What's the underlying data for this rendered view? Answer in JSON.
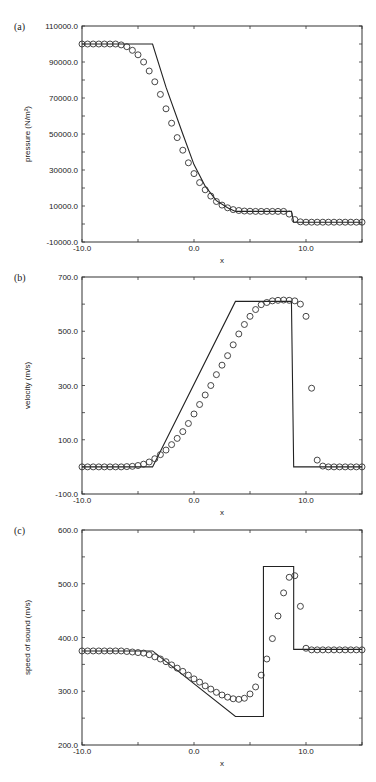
{
  "chart_data": [
    {
      "type": "line",
      "panel_label": "(a)",
      "title": "",
      "xlabel": "x",
      "ylabel": "pressure (N/m²)",
      "xlim": [
        -10,
        15
      ],
      "ylim": [
        -10000,
        110000
      ],
      "x_ticks": [
        -10,
        0,
        10
      ],
      "x_tick_labels": [
        "-10.0",
        "0.0",
        "10.0"
      ],
      "y_ticks": [
        -10000,
        10000,
        30000,
        50000,
        70000,
        90000,
        110000
      ],
      "y_tick_labels": [
        "-10000.0",
        "10000.0",
        "30000.0",
        "50000.0",
        "70000.0",
        "90000.0",
        "110000.0"
      ],
      "grid": false,
      "series": [
        {
          "name": "exact",
          "style": "line",
          "x": [
            -10,
            -3.7,
            -2.5,
            -1.0,
            0.0,
            1.0,
            2.0,
            3.0,
            3.7,
            8.7,
            8.9,
            15
          ],
          "y": [
            100000,
            100000,
            76000,
            50000,
            33000,
            21000,
            13000,
            9000,
            7000,
            7000,
            1000,
            1000
          ]
        },
        {
          "name": "numerical",
          "style": "circles",
          "x": [
            -10,
            -9.5,
            -9,
            -8.5,
            -8,
            -7.5,
            -7,
            -6.5,
            -6,
            -5.5,
            -5,
            -4.5,
            -4,
            -3.5,
            -3,
            -2.5,
            -2,
            -1.5,
            -1,
            -0.5,
            0,
            0.5,
            1,
            1.5,
            2,
            2.5,
            3,
            3.5,
            4,
            4.5,
            5,
            5.5,
            6,
            6.5,
            7,
            7.5,
            8,
            8.5,
            9,
            9.5,
            10,
            10.5,
            11,
            11.5,
            12,
            12.5,
            13,
            13.5,
            14,
            14.5,
            15
          ],
          "y": [
            100000,
            100000,
            100000,
            100000,
            100000,
            100000,
            100000,
            99500,
            98500,
            96500,
            94000,
            90000,
            85000,
            79000,
            72000,
            64000,
            56000,
            48000,
            41000,
            34000,
            28000,
            23000,
            19000,
            15500,
            12500,
            10500,
            9000,
            8000,
            7500,
            7200,
            7100,
            7000,
            7000,
            7000,
            7000,
            7000,
            7000,
            5500,
            2500,
            1200,
            1000,
            1000,
            1000,
            1000,
            1000,
            1000,
            1000,
            1000,
            1000,
            1000,
            1000
          ]
        }
      ]
    },
    {
      "type": "line",
      "panel_label": "(b)",
      "title": "",
      "xlabel": "x",
      "ylabel": "velocity (m/s)",
      "xlim": [
        -10,
        15
      ],
      "ylim": [
        -100,
        700
      ],
      "x_ticks": [
        -10,
        0,
        10
      ],
      "x_tick_labels": [
        "-10.0",
        "0.0",
        "10.0"
      ],
      "y_ticks": [
        -100,
        100,
        300,
        500,
        700
      ],
      "y_tick_labels": [
        "-100.0",
        "100.0",
        "300.0",
        "500.0",
        "700.0"
      ],
      "grid": false,
      "series": [
        {
          "name": "exact",
          "style": "line",
          "x": [
            -10,
            -3.7,
            3.7,
            8.7,
            8.9,
            15
          ],
          "y": [
            0,
            0,
            610,
            610,
            0,
            0
          ]
        },
        {
          "name": "numerical",
          "style": "circles",
          "x": [
            -10,
            -9.5,
            -9,
            -8.5,
            -8,
            -7.5,
            -7,
            -6.5,
            -6,
            -5.5,
            -5,
            -4.5,
            -4,
            -3.5,
            -3,
            -2.5,
            -2,
            -1.5,
            -1,
            -0.5,
            0,
            0.5,
            1,
            1.5,
            2,
            2.5,
            3,
            3.5,
            4,
            4.5,
            5,
            5.5,
            6,
            6.5,
            7,
            7.5,
            8,
            8.5,
            9,
            9.5,
            10,
            10.5,
            11,
            11.5,
            12,
            12.5,
            13,
            13.5,
            14,
            14.5,
            15
          ],
          "y": [
            0,
            0,
            0,
            0,
            0,
            0,
            0,
            0,
            1,
            2,
            5,
            10,
            18,
            30,
            45,
            62,
            82,
            105,
            130,
            160,
            195,
            230,
            265,
            300,
            340,
            375,
            410,
            450,
            490,
            525,
            555,
            580,
            598,
            606,
            612,
            614,
            615,
            614,
            612,
            600,
            555,
            290,
            25,
            3,
            0,
            0,
            0,
            0,
            0,
            0,
            0
          ]
        }
      ]
    },
    {
      "type": "line",
      "panel_label": "(c)",
      "title": "",
      "xlabel": "x",
      "ylabel": "speed of sound (m/s)",
      "xlim": [
        -10,
        15
      ],
      "ylim": [
        200,
        600
      ],
      "x_ticks": [
        -10,
        0,
        10
      ],
      "x_tick_labels": [
        "-10.0",
        "0.0",
        "10.0"
      ],
      "y_ticks": [
        200,
        300,
        400,
        500,
        600
      ],
      "y_tick_labels": [
        "200.0",
        "300.0",
        "400.0",
        "500.0",
        "600.0"
      ],
      "grid": false,
      "series": [
        {
          "name": "exact",
          "style": "line",
          "x": [
            -10,
            -3.7,
            3.7,
            6.2,
            6.2,
            8.9,
            8.9,
            15
          ],
          "y": [
            375,
            375,
            253,
            253,
            532,
            532,
            378,
            378
          ]
        },
        {
          "name": "numerical",
          "style": "circles",
          "x": [
            -10,
            -9.5,
            -9,
            -8.5,
            -8,
            -7.5,
            -7,
            -6.5,
            -6,
            -5.5,
            -5,
            -4.5,
            -4,
            -3.5,
            -3,
            -2.5,
            -2,
            -1.5,
            -1,
            -0.5,
            0,
            0.5,
            1,
            1.5,
            2,
            2.5,
            3,
            3.5,
            4,
            4.5,
            5,
            5.5,
            6,
            6.5,
            7,
            7.5,
            8,
            8.5,
            9,
            9.5,
            10,
            10.5,
            11,
            11.5,
            12,
            12.5,
            13,
            13.5,
            14,
            14.5,
            15
          ],
          "y": [
            375,
            375,
            375,
            375,
            375,
            375,
            375,
            375,
            374,
            373,
            372,
            371,
            368,
            364,
            360,
            355,
            349,
            343,
            337,
            330,
            323,
            317,
            310,
            304,
            298,
            293,
            289,
            286,
            285,
            287,
            295,
            308,
            330,
            360,
            398,
            440,
            483,
            512,
            515,
            458,
            380,
            377,
            377,
            377,
            377,
            377,
            377,
            377,
            377,
            377,
            377
          ]
        }
      ]
    }
  ]
}
